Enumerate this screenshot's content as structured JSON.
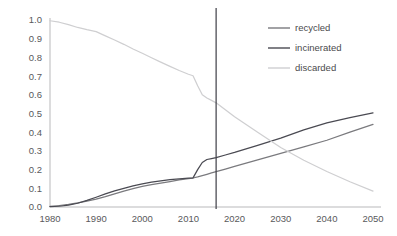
{
  "chart_data": {
    "type": "line",
    "title": "",
    "subtitle": "",
    "xlabel": "",
    "ylabel": "",
    "xlim": [
      1980,
      2050
    ],
    "ylim": [
      0.0,
      1.0
    ],
    "grid": false,
    "legend_position": "top-right",
    "x_ticks": [
      "1980",
      "1990",
      "2000",
      "2010",
      "2020",
      "2030",
      "2040",
      "2050"
    ],
    "x_tick_values": [
      1980,
      1990,
      2000,
      2010,
      2020,
      2030,
      2040,
      2050
    ],
    "y_ticks": [
      "0.0",
      "0.1",
      "0.2",
      "0.3",
      "0.4",
      "0.5",
      "0.6",
      "0.7",
      "0.8",
      "0.9",
      "1.0"
    ],
    "y_tick_values": [
      0.0,
      0.1,
      0.2,
      0.3,
      0.4,
      0.5,
      0.6,
      0.7,
      0.8,
      0.9,
      1.0
    ],
    "annotations": [
      {
        "name": "present-year-marker",
        "type": "vline",
        "x": 2016,
        "label": ""
      }
    ],
    "x": [
      1980,
      1982,
      1984,
      1986,
      1988,
      1990,
      1992,
      1994,
      1996,
      1998,
      2000,
      2002,
      2004,
      2006,
      2008,
      2010,
      2011,
      2012,
      2013,
      2014,
      2015,
      2016,
      2018,
      2020,
      2025,
      2030,
      2035,
      2040,
      2045,
      2050
    ],
    "series": [
      {
        "name": "recycled",
        "color": "#7a7a7e",
        "values": [
          0.003,
          0.008,
          0.014,
          0.022,
          0.031,
          0.042,
          0.055,
          0.07,
          0.085,
          0.098,
          0.11,
          0.12,
          0.128,
          0.136,
          0.145,
          0.152,
          0.155,
          0.161,
          0.168,
          0.175,
          0.182,
          0.189,
          0.203,
          0.217,
          0.252,
          0.287,
          0.322,
          0.357,
          0.4,
          0.442
        ]
      },
      {
        "name": "incinerated",
        "color": "#4a4a52",
        "values": [
          0.002,
          0.004,
          0.01,
          0.02,
          0.035,
          0.052,
          0.07,
          0.086,
          0.1,
          0.113,
          0.124,
          0.133,
          0.14,
          0.146,
          0.151,
          0.154,
          0.156,
          0.2,
          0.238,
          0.254,
          0.259,
          0.264,
          0.278,
          0.292,
          0.33,
          0.368,
          0.412,
          0.45,
          0.478,
          0.503
        ]
      },
      {
        "name": "discarded",
        "color": "#cfcfd1",
        "values": [
          0.996,
          0.988,
          0.975,
          0.96,
          0.948,
          0.938,
          0.915,
          0.893,
          0.87,
          0.845,
          0.822,
          0.798,
          0.775,
          0.752,
          0.73,
          0.71,
          0.702,
          0.648,
          0.6,
          0.583,
          0.57,
          0.557,
          0.52,
          0.483,
          0.4,
          0.318,
          0.25,
          0.19,
          0.135,
          0.085
        ]
      }
    ]
  },
  "legend": {
    "items": [
      {
        "label": "recycled",
        "color": "#7a7a7e"
      },
      {
        "label": "incinerated",
        "color": "#4a4a52"
      },
      {
        "label": "discarded",
        "color": "#cfcfd1"
      }
    ]
  }
}
